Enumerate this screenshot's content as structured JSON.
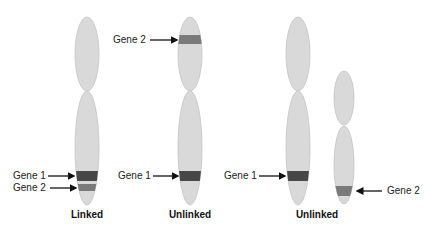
{
  "diagram": {
    "colors": {
      "chromosome_fill": "#d9d9d9",
      "chromosome_stroke": "#c4c4c4",
      "gene1_band": "#474747",
      "gene2_band": "#7a7a7a",
      "arrow": "#111111"
    },
    "panels": [
      {
        "caption": "Linked",
        "chromosomes": [
          {
            "id": "chr-a",
            "genes": [
              {
                "name": "Gene 1",
                "label": "Gene 1",
                "side": "left"
              },
              {
                "name": "Gene 2",
                "label": "Gene 2",
                "side": "left"
              }
            ]
          }
        ]
      },
      {
        "caption": "Unlinked",
        "chromosomes": [
          {
            "id": "chr-b",
            "genes": [
              {
                "name": "Gene 2",
                "label": "Gene 2",
                "side": "left"
              },
              {
                "name": "Gene 1",
                "label": "Gene 1",
                "side": "left"
              }
            ]
          }
        ]
      },
      {
        "caption": "Unlinked",
        "chromosomes": [
          {
            "id": "chr-c",
            "genes": [
              {
                "name": "Gene 1",
                "label": "Gene 1",
                "side": "left"
              }
            ]
          },
          {
            "id": "chr-d",
            "genes": [
              {
                "name": "Gene 2",
                "label": "Gene 2",
                "side": "right"
              }
            ]
          }
        ]
      }
    ]
  }
}
